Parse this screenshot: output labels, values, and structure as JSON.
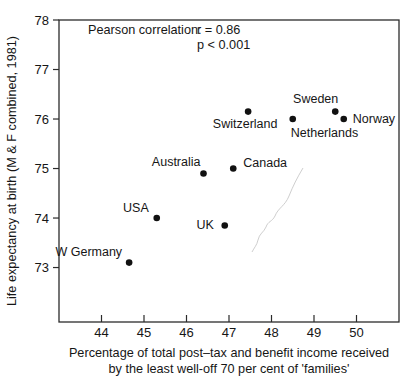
{
  "figure": {
    "background": "#ffffff",
    "ink_color": "#161616",
    "marker_color": "#111111",
    "frame_color": "#2b2b2b",
    "crease_color": "#bdbdbd"
  },
  "chart_data": {
    "type": "scatter",
    "title": "",
    "xlabel_line1": "Percentage of total post–tax and benefit income received",
    "xlabel_line2": "by the least well-off 70 per cent of 'families'",
    "ylabel": "Life expectancy at birth (M & F combined, 1981)",
    "xlim": [
      43,
      51
    ],
    "ylim": [
      71.9,
      78
    ],
    "x_ticks": [
      44,
      45,
      46,
      47,
      48,
      49,
      50
    ],
    "y_ticks": [
      73,
      74,
      75,
      76,
      77,
      78
    ],
    "grid": false,
    "legend": "none",
    "annotation": {
      "label": "Pearson correlation:",
      "r_value": "r = 0.86",
      "p_value": "p < 0.001"
    },
    "points": [
      {
        "name": "W Germany",
        "x": 44.65,
        "y": 73.1,
        "label_anchor": "end",
        "label_dx": -7,
        "label_dy": -7
      },
      {
        "name": "USA",
        "x": 45.3,
        "y": 74.0,
        "label_anchor": "end",
        "label_dx": -8,
        "label_dy": -6
      },
      {
        "name": "UK",
        "x": 46.9,
        "y": 73.85,
        "label_anchor": "end",
        "label_dx": -11,
        "label_dy": 4
      },
      {
        "name": "Australia",
        "x": 46.4,
        "y": 74.9,
        "label_anchor": "end",
        "label_dx": -3,
        "label_dy": -7
      },
      {
        "name": "Canada",
        "x": 47.1,
        "y": 75.0,
        "label_anchor": "start",
        "label_dx": 10,
        "label_dy": -2
      },
      {
        "name": "Switzerland",
        "x": 47.45,
        "y": 76.15,
        "label_anchor": "middle",
        "label_dx": -3,
        "label_dy": 16
      },
      {
        "name": "Sweden",
        "x": 49.5,
        "y": 76.15,
        "label_anchor": "end",
        "label_dx": 3,
        "label_dy": -9
      },
      {
        "name": "Netherlands",
        "x": 48.5,
        "y": 76.0,
        "label_anchor": "start",
        "label_dx": -2,
        "label_dy": 18
      },
      {
        "name": "Norway",
        "x": 49.7,
        "y": 76.0,
        "label_anchor": "start",
        "label_dx": 9,
        "label_dy": 4
      }
    ]
  }
}
